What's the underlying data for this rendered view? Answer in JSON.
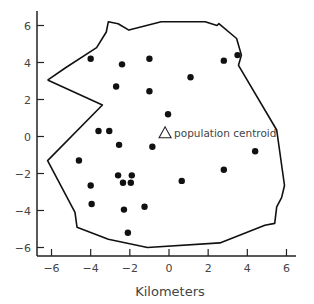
{
  "chart_data": {
    "type": "scatter",
    "title": "",
    "xlabel": "Kilometers",
    "ylabel": "",
    "xlim": [
      -6.7,
      6.8
    ],
    "ylim": [
      -6.5,
      6.6
    ],
    "grid": false,
    "x_ticks": [
      -6,
      -4,
      -2,
      0,
      2,
      4,
      6
    ],
    "y_ticks": [
      -6,
      -4,
      -2,
      0,
      2,
      4,
      6
    ],
    "x_tick_labels": [
      "-6",
      "-4",
      "-2",
      "0",
      "2",
      "4",
      "6"
    ],
    "y_tick_labels": [
      "-6",
      "-4",
      "-2",
      "0",
      "2",
      "4",
      "6"
    ],
    "series": [
      {
        "name": "points",
        "marker": "filled-circle",
        "x": [
          -4.0,
          -2.4,
          -1.0,
          1.1,
          -2.7,
          -1.0,
          -0.05,
          -3.6,
          -3.05,
          -2.55,
          -0.85,
          2.8,
          3.5,
          4.4,
          2.8,
          0.65,
          -4.6,
          -2.6,
          -1.9,
          -2.35,
          -1.95,
          -4.0,
          -3.95,
          -2.3,
          -1.25,
          -2.1
        ],
        "y": [
          4.2,
          3.9,
          4.2,
          3.2,
          2.7,
          2.45,
          1.2,
          0.3,
          0.3,
          -0.45,
          -0.55,
          4.1,
          4.4,
          -0.8,
          -1.8,
          -2.4,
          -1.3,
          -2.1,
          -2.1,
          -2.5,
          -2.5,
          -2.65,
          -3.65,
          -3.95,
          -3.8,
          -5.2
        ]
      }
    ],
    "annotations": [
      {
        "text": "population centroid",
        "marker": "open-triangle",
        "x": -0.2,
        "y": 0.2
      }
    ],
    "boundary_polygon": {
      "name": "boundary",
      "x": [
        -6.2,
        -5.3,
        -3.7,
        -3.2,
        -3.1,
        -2.6,
        -2.05,
        -0.4,
        1.85,
        2.45,
        2.55,
        3.45,
        3.7,
        3.55,
        5.5,
        5.9,
        5.75,
        5.5,
        5.4,
        4.9,
        2.6,
        -1.1,
        -3.1,
        -4.7,
        -4.8,
        -6.2,
        -3.4,
        -6.2
      ],
      "y": [
        3.05,
        3.7,
        4.8,
        5.65,
        6.2,
        6.1,
        5.75,
        6.2,
        6.2,
        6.0,
        6.1,
        5.3,
        4.4,
        3.85,
        0.35,
        -2.65,
        -3.3,
        -3.8,
        -4.7,
        -4.8,
        -5.75,
        -6.0,
        -5.55,
        -4.9,
        -4.1,
        -1.3,
        1.7,
        3.05
      ]
    }
  },
  "axes": {
    "xlabel": "Kilometers"
  },
  "legend": {
    "centroid_label": "population centroid"
  }
}
